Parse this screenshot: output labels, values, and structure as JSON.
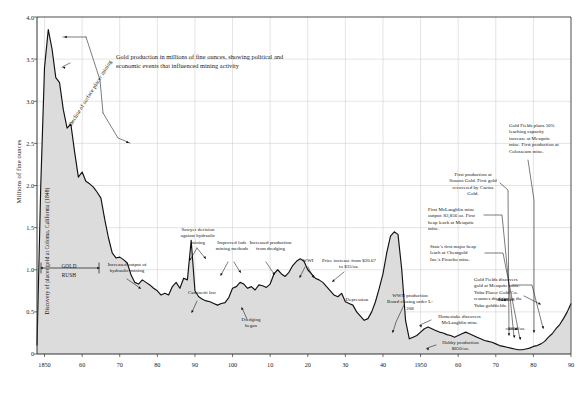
{
  "chart_data": {
    "type": "area",
    "title": "Gold production in millions of fine ounces, showing political and economic events that influenced mining activity",
    "xlabel": "",
    "ylabel": "Millions of fine ounces",
    "xlim": [
      1848,
      1990
    ],
    "ylim": [
      0,
      4.0
    ],
    "grid": true,
    "legend": "none",
    "yticks": [
      "0",
      "0.5",
      "1.0",
      "1.5",
      "2.0",
      "2.5",
      "3.0",
      "3.5",
      "4.0"
    ],
    "ytick_values": [
      0,
      0.5,
      1.0,
      1.5,
      2.0,
      2.5,
      3.0,
      3.5,
      4.0
    ],
    "xticks": [
      "1850",
      "60",
      "70",
      "80",
      "90",
      "100",
      "10",
      "20",
      "30",
      "40",
      "1950",
      "60",
      "70",
      "80",
      "90"
    ],
    "xtick_values": [
      1850,
      1860,
      1870,
      1880,
      1890,
      1900,
      1910,
      1920,
      1930,
      1940,
      1950,
      1960,
      1970,
      1980,
      1990
    ],
    "x": [
      1848,
      1849,
      1850,
      1851,
      1852,
      1853,
      1854,
      1855,
      1856,
      1857,
      1858,
      1859,
      1860,
      1861,
      1862,
      1863,
      1864,
      1865,
      1866,
      1867,
      1868,
      1869,
      1870,
      1871,
      1872,
      1873,
      1874,
      1875,
      1876,
      1877,
      1878,
      1879,
      1880,
      1881,
      1882,
      1883,
      1884,
      1885,
      1886,
      1887,
      1888,
      1889,
      1890,
      1891,
      1892,
      1893,
      1894,
      1895,
      1896,
      1897,
      1898,
      1899,
      1900,
      1901,
      1902,
      1903,
      1904,
      1905,
      1906,
      1907,
      1908,
      1909,
      1910,
      1911,
      1912,
      1913,
      1914,
      1915,
      1916,
      1917,
      1918,
      1919,
      1920,
      1921,
      1922,
      1923,
      1924,
      1925,
      1926,
      1927,
      1928,
      1929,
      1930,
      1931,
      1932,
      1933,
      1934,
      1935,
      1936,
      1937,
      1938,
      1939,
      1940,
      1941,
      1942,
      1943,
      1944,
      1945,
      1946,
      1947,
      1948,
      1949,
      1950,
      1951,
      1952,
      1953,
      1954,
      1955,
      1956,
      1957,
      1958,
      1959,
      1960,
      1961,
      1962,
      1963,
      1964,
      1965,
      1966,
      1967,
      1968,
      1969,
      1970,
      1971,
      1972,
      1973,
      1974,
      1975,
      1976,
      1977,
      1978,
      1979,
      1980,
      1981,
      1982,
      1983,
      1984,
      1985,
      1986,
      1987,
      1988,
      1989,
      1990
    ],
    "values": [
      0.1,
      2.0,
      3.4,
      3.85,
      3.62,
      3.28,
      3.22,
      2.9,
      2.68,
      2.73,
      2.4,
      2.1,
      2.16,
      2.05,
      2.02,
      1.98,
      1.92,
      1.85,
      1.6,
      1.38,
      1.2,
      1.14,
      1.15,
      1.12,
      1.08,
      0.94,
      0.85,
      0.83,
      0.88,
      0.85,
      0.82,
      0.78,
      0.75,
      0.7,
      0.72,
      0.7,
      0.8,
      0.85,
      0.78,
      0.9,
      0.88,
      1.35,
      0.75,
      0.68,
      0.65,
      0.63,
      0.62,
      0.6,
      0.58,
      0.6,
      0.61,
      0.67,
      0.78,
      0.8,
      0.85,
      0.83,
      0.78,
      0.8,
      0.76,
      0.82,
      0.81,
      0.79,
      0.83,
      0.95,
      1.0,
      0.95,
      0.92,
      0.97,
      1.05,
      1.1,
      1.13,
      1.1,
      1.0,
      0.95,
      0.9,
      0.88,
      0.85,
      0.8,
      0.75,
      0.7,
      0.68,
      0.72,
      0.62,
      0.6,
      0.58,
      0.5,
      0.45,
      0.4,
      0.42,
      0.5,
      0.62,
      0.78,
      0.95,
      1.2,
      1.4,
      1.45,
      1.42,
      1.0,
      0.4,
      0.18,
      0.2,
      0.22,
      0.26,
      0.3,
      0.32,
      0.3,
      0.28,
      0.26,
      0.25,
      0.23,
      0.22,
      0.2,
      0.22,
      0.24,
      0.26,
      0.24,
      0.22,
      0.2,
      0.18,
      0.16,
      0.15,
      0.14,
      0.12,
      0.1,
      0.09,
      0.08,
      0.07,
      0.06,
      0.05,
      0.05,
      0.06,
      0.07,
      0.09,
      0.1,
      0.12,
      0.15,
      0.2,
      0.24,
      0.3,
      0.35,
      0.42,
      0.5,
      0.6
    ]
  },
  "axis": {
    "ylabel": "Millions of fine ounces",
    "inside_label": "Discovery of placer gold at Coloma, California (1848)"
  },
  "annotations": {
    "decline": "Decline of surface placer mining",
    "gold_rush": "GOLD\nRUSH",
    "gold_rush_line1": "GOLD",
    "gold_rush_line2": "RUSH",
    "hydraulic": "Increased output of hydraulic mining",
    "sawyer": "Sawyer decision against hydraulic mining",
    "caminetti": "Caminetti law",
    "lode": "Improved lode mining methods",
    "dredging_prod": "Increased production from dredging",
    "dredging_began": "Dredging began",
    "wwi": "WWI",
    "price_increase": "Price increase from $20.67 to $35/oz.",
    "depression": "Depression",
    "wwii": "WWII production Board closing order L-208",
    "homestake": "Homestake discovers McLaughlin mine",
    "hobby": "Hobby production $850/oz.",
    "picacho": "State's first major heap leach at Chemgold Inc.'s Picacho mine.",
    "mclaughlin": "First McLaughlin mine output: 83,856 oz. First heap leach at Mesquite mine.",
    "sonora": "First production at Sonora Gold. First gold recovered by Cactus Gold.",
    "goldfields": "Gold Fields plans 50% leaching capacity increase at Mesquite mine. First production at Colosseum mine.",
    "mesquite_yuba": "Gold Fields discovers gold at Mesquite mine. Yuba Placer Gold Co. resumes dredging in the Yuba goldfields.",
    "price_440": "$440/oz.",
    "price_850": "$850/oz."
  },
  "colors": {
    "fill": "#dcdcdc",
    "line": "#111111",
    "grid": "#c9c9c9",
    "axis": "#333333",
    "text": "#1b1b1b"
  }
}
